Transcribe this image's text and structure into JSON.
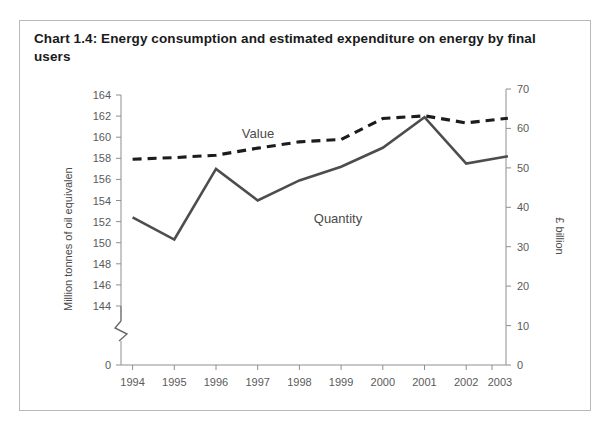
{
  "card": {
    "title": "Chart 1.4:  Energy consumption and estimated expenditure on energy by final users"
  },
  "chart_data": {
    "type": "line",
    "title": "Chart 1.4:  Energy consumption and estimated expenditure on energy by final users",
    "xlabel": "",
    "categories": [
      "1994",
      "1995",
      "1996",
      "1997",
      "1998",
      "1999",
      "2000",
      "2001",
      "2002",
      "2003"
    ],
    "series": [
      {
        "name": "Quantity",
        "axis": "left",
        "unit": "Million tonnes of oil equivalent",
        "style": "solid",
        "color": "#4d4d4d",
        "values": [
          152.4,
          150.3,
          157.0,
          154.0,
          155.9,
          157.2,
          159.0,
          161.9,
          157.5,
          158.2
        ]
      },
      {
        "name": "Value",
        "axis": "right",
        "unit": "£ billion",
        "style": "dashed",
        "color": "#1c1c1c",
        "values": [
          52.2,
          52.6,
          53.2,
          55.0,
          56.6,
          57.2,
          62.5,
          63.2,
          61.4,
          62.6
        ]
      }
    ],
    "axes": {
      "left": {
        "label": "Million tonnes of oil equivalen",
        "ticks": [
          144,
          146,
          148,
          150,
          152,
          154,
          156,
          158,
          160,
          162,
          164
        ],
        "zero_tick": "0",
        "ylim": [
          144,
          164
        ],
        "has_axis_break": true
      },
      "right": {
        "label": "£ billion",
        "ticks": [
          0,
          10,
          20,
          30,
          40,
          50,
          60,
          70
        ],
        "ylim": [
          0,
          70
        ]
      }
    },
    "grid": false,
    "legend": "inline-labels",
    "annotations": [
      {
        "text": "Value",
        "series": "Value"
      },
      {
        "text": "Quantity",
        "series": "Quantity"
      }
    ]
  },
  "axis": {
    "left_title": "Million tonnes of oil equivalen",
    "right_title": "£ billion",
    "left_ticks": [
      "164",
      "162",
      "160",
      "158",
      "156",
      "154",
      "152",
      "150",
      "148",
      "146",
      "144",
      "0"
    ],
    "right_ticks": [
      "70",
      "60",
      "50",
      "40",
      "30",
      "20",
      "10",
      "0"
    ],
    "x_ticks": [
      "1994",
      "1995",
      "1996",
      "1997",
      "1998",
      "1999",
      "2000",
      "2001",
      "2002",
      "2003"
    ]
  },
  "labels": {
    "value": "Value",
    "quantity": "Quantity"
  }
}
